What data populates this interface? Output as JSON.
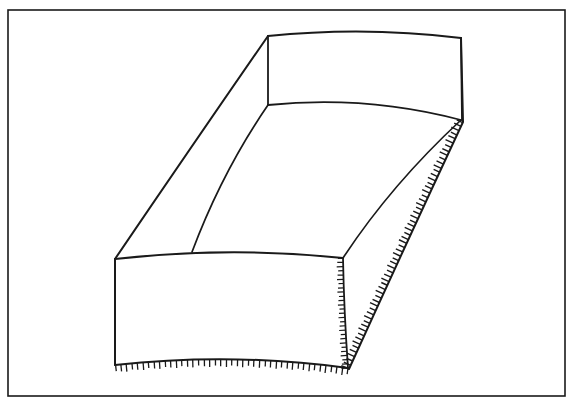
{
  "figure": {
    "title": "",
    "kind": "line-drawing",
    "background_color": "#ffffff",
    "ink_color": "#1a1a1a",
    "frame": {
      "name": "figure-border",
      "x": 8,
      "y": 10,
      "width": 557,
      "height": 386,
      "stroke_width": 1.6
    },
    "caption_remnant": "",
    "geometry": {
      "stroke_width_outline": 2.0,
      "stroke_width_inner": 1.5,
      "hatch_stroke_width": 1.3,
      "hatch_length": 7,
      "hatch_spacing": 5,
      "far_face": {
        "name": "far-end-face",
        "top_left": [
          268,
          36
        ],
        "top_right": [
          461,
          38
        ],
        "bottom_left": [
          268,
          105
        ],
        "bottom_right": [
          461,
          120
        ],
        "top_edge_sag": 8,
        "bottom_edge_sag": 9
      },
      "near_face": {
        "name": "near-end-face",
        "top_left": [
          115,
          259
        ],
        "top_right": [
          343,
          258
        ],
        "bottom_left": [
          115,
          365
        ],
        "bottom_right": [
          348,
          368
        ],
        "top_edge_sag": 9,
        "bottom_edge_sag": 10
      },
      "edges": {
        "outer_left": [
          [
            268,
            36
          ],
          [
            115,
            259
          ]
        ],
        "outer_right": [
          [
            461,
            38
          ],
          [
            348,
            368
          ]
        ],
        "inner_left": [
          [
            268,
            105
          ],
          [
            192,
            252
          ]
        ],
        "inner_right": [
          [
            461,
            120
          ],
          [
            343,
            258
          ]
        ]
      },
      "hatched_edges": [
        {
          "name": "bottom-near-edge-hatch",
          "from": [
            115,
            365
          ],
          "to": [
            348,
            368
          ],
          "direction": "outward-down"
        },
        {
          "name": "right-near-vertical-edge-hatch",
          "from": [
            343,
            258
          ],
          "to": [
            348,
            368
          ],
          "direction": "outward-left"
        },
        {
          "name": "right-outer-edge-hatch",
          "from": [
            463,
            122
          ],
          "to": [
            349,
            369
          ],
          "direction": "outward-left"
        }
      ]
    }
  }
}
